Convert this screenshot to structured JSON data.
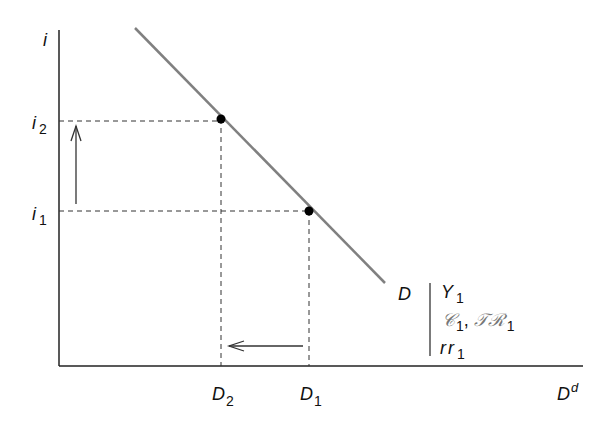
{
  "diagram": {
    "type": "money-demand-curve",
    "axes": {
      "y_label": "i",
      "x_label": "D",
      "x_label_sup": "d"
    },
    "y_ticks": [
      {
        "base": "i",
        "sub": "2"
      },
      {
        "base": "i",
        "sub": "1"
      }
    ],
    "x_ticks": [
      {
        "base": "D",
        "sub": "2"
      },
      {
        "base": "D",
        "sub": "1"
      }
    ],
    "curve": {
      "label": "D",
      "color": "#808080",
      "shift_params": [
        {
          "base": "Y",
          "sub": "1"
        },
        {
          "base": "𝒞",
          "sub": "1",
          "extra_base": "𝒯ℛ",
          "extra_sub": "1"
        },
        {
          "base": "rr",
          "sub": "1"
        }
      ]
    },
    "points": [
      {
        "name": "i2-D2",
        "x": 221,
        "y": 119
      },
      {
        "name": "i1-D1",
        "x": 309,
        "y": 211
      }
    ],
    "arrows": [
      {
        "name": "interest-rate-up",
        "direction": "up"
      },
      {
        "name": "demand-left",
        "direction": "left"
      }
    ]
  }
}
